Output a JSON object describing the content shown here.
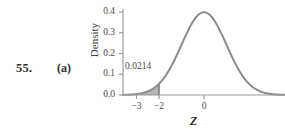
{
  "problem": {
    "number": "55.",
    "part": "(a)"
  },
  "chart_data": {
    "type": "line",
    "title": "",
    "subtitle": "",
    "xlabel": "Z",
    "ylabel": "Density",
    "distribution": "standard normal",
    "mean": 0,
    "sd": 1,
    "xlim": [
      -3.6,
      3.6
    ],
    "ylim": [
      0.0,
      0.4
    ],
    "grid": false,
    "legend": null,
    "xticks": [
      -3,
      -2,
      0
    ],
    "xtick_labels": [
      "−3",
      "−2",
      "0"
    ],
    "yticks": [
      0.0,
      0.1,
      0.2,
      0.3,
      0.4
    ],
    "ytick_labels": [
      "0.0",
      "0.1",
      "0.2",
      "0.3",
      "0.4"
    ],
    "shaded_region": {
      "from": -3.6,
      "to": -2,
      "label": "0.0214",
      "area": 0.0214,
      "fill_color": "#a8a8a8"
    },
    "curve_color": "#8c8c8c",
    "axis_color": "#9a9a9a",
    "x": [
      -3.6,
      -3.4,
      -3.2,
      -3.0,
      -2.8,
      -2.6,
      -2.4,
      -2.2,
      -2.0,
      -1.8,
      -1.6,
      -1.4,
      -1.2,
      -1.0,
      -0.8,
      -0.6,
      -0.4,
      -0.2,
      0.0,
      0.2,
      0.4,
      0.6,
      0.8,
      1.0,
      1.2,
      1.4,
      1.6,
      1.8,
      2.0,
      2.2,
      2.4,
      2.6,
      2.8,
      3.0,
      3.2,
      3.4,
      3.6
    ],
    "y": [
      0.0006,
      0.0012,
      0.0024,
      0.0044,
      0.0079,
      0.0136,
      0.0224,
      0.0355,
      0.054,
      0.079,
      0.1109,
      0.1497,
      0.1942,
      0.242,
      0.2897,
      0.3332,
      0.3683,
      0.391,
      0.3989,
      0.391,
      0.3683,
      0.3332,
      0.2897,
      0.242,
      0.1942,
      0.1497,
      0.1109,
      0.079,
      0.054,
      0.0355,
      0.0224,
      0.0136,
      0.0079,
      0.0044,
      0.0024,
      0.0012,
      0.0006
    ]
  }
}
